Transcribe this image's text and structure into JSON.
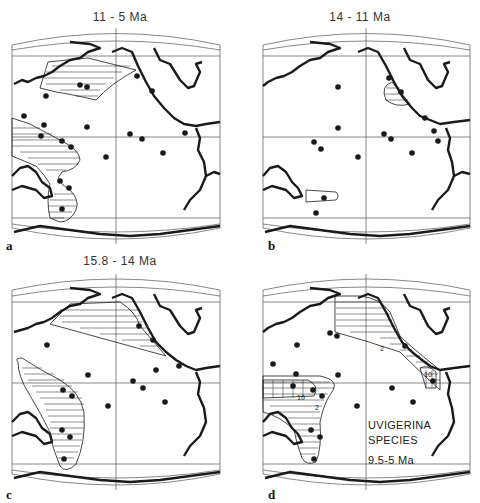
{
  "figure": {
    "panels": [
      {
        "id": "a",
        "letter": "a",
        "title": "11 - 5 Ma"
      },
      {
        "id": "b",
        "letter": "b",
        "title": "14 - 11 Ma"
      },
      {
        "id": "c",
        "letter": "c",
        "title": "15.8 - 14 Ma"
      },
      {
        "id": "d",
        "letter": "d",
        "title": "",
        "legend": {
          "line1": "UVIGERINA",
          "line2": "SPECIES",
          "line3": "9.5-5 Ma"
        },
        "contours": {
          "c2": "2",
          "c10": "10",
          "c2b": "2",
          "c10b": "10"
        }
      }
    ]
  },
  "colors": {
    "ink": "#1a1a1a",
    "background": "#ffffff",
    "grid": "#555555"
  }
}
